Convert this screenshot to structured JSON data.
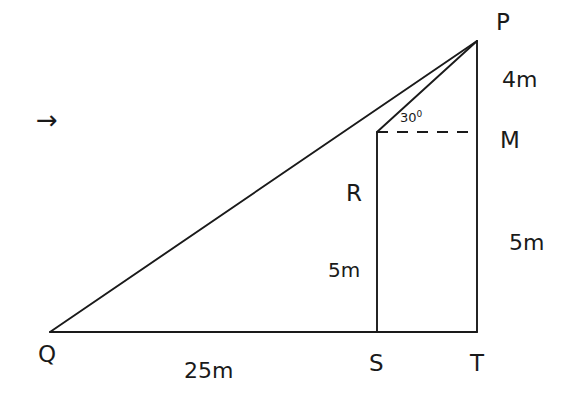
{
  "figure": {
    "type": "geometry-diagram",
    "stroke_color": "#1a1a1a",
    "background_color": "#ffffff",
    "vertices": {
      "P": {
        "label": "P",
        "x": 477,
        "y": 41,
        "label_x": 496,
        "label_y": 11
      },
      "Q": {
        "label": "Q",
        "x": 50,
        "y": 332,
        "label_x": 38,
        "label_y": 343
      },
      "S": {
        "label": "S",
        "x": 377,
        "y": 332,
        "label_x": 369,
        "label_y": 352
      },
      "T": {
        "label": "T",
        "x": 477,
        "y": 332,
        "label_x": 470,
        "label_y": 352
      },
      "M": {
        "label": "M",
        "x": 477,
        "y": 132,
        "label_x": 500,
        "label_y": 129
      },
      "R": {
        "label": "R",
        "x": 377,
        "y": 132,
        "label_x": 346,
        "label_y": 182
      }
    },
    "segments": [
      {
        "name": "base-QT",
        "from": "Q",
        "to": "T",
        "style": "solid"
      },
      {
        "name": "hypotenuse-QP",
        "from": "Q",
        "to": "P",
        "style": "solid"
      },
      {
        "name": "vertical-PT",
        "from": "P",
        "to": "T",
        "style": "solid"
      },
      {
        "name": "vertical-RS",
        "from": "R",
        "to": "S",
        "style": "solid"
      },
      {
        "name": "sightline-RP",
        "from": "R",
        "to": "P",
        "style": "solid"
      },
      {
        "name": "horizontal-RM",
        "from": "R",
        "to": "M",
        "style": "dashed"
      }
    ],
    "dimensions": {
      "top_right": {
        "value": "4m",
        "x": 502,
        "y": 69
      },
      "bottom_right": {
        "value": "5m",
        "x": 509,
        "y": 232
      },
      "inner_height": {
        "value": "5m",
        "x": 328,
        "y": 260
      },
      "base": {
        "value": "25m",
        "x": 184,
        "y": 360
      }
    },
    "angle": {
      "value": "30",
      "unit": "0",
      "display": "30°",
      "x": 400,
      "y": 110
    },
    "direction_marker": {
      "glyph": "→",
      "name": "right-arrow",
      "x": 36,
      "y": 107
    }
  }
}
